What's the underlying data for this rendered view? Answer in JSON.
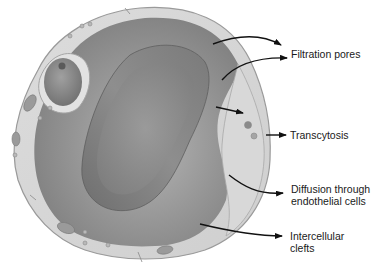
{
  "diagram": {
    "labels": [
      {
        "id": "filtration-pores",
        "lines": [
          "Filtration pores"
        ]
      },
      {
        "id": "transcytosis",
        "lines": [
          "Transcytosis"
        ]
      },
      {
        "id": "diffusion",
        "lines": [
          "Diffusion through",
          "endothelial cells"
        ]
      },
      {
        "id": "intercellular-clefts",
        "lines": [
          "Intercellular",
          "clefts"
        ]
      }
    ],
    "colors": {
      "background": "#ffffff",
      "lumen": "#8a8a8a",
      "endothelium": "#d4d4d4",
      "rbc": "#7a7a7a",
      "arrow": "#111111",
      "text": "#1a1a1a"
    }
  }
}
